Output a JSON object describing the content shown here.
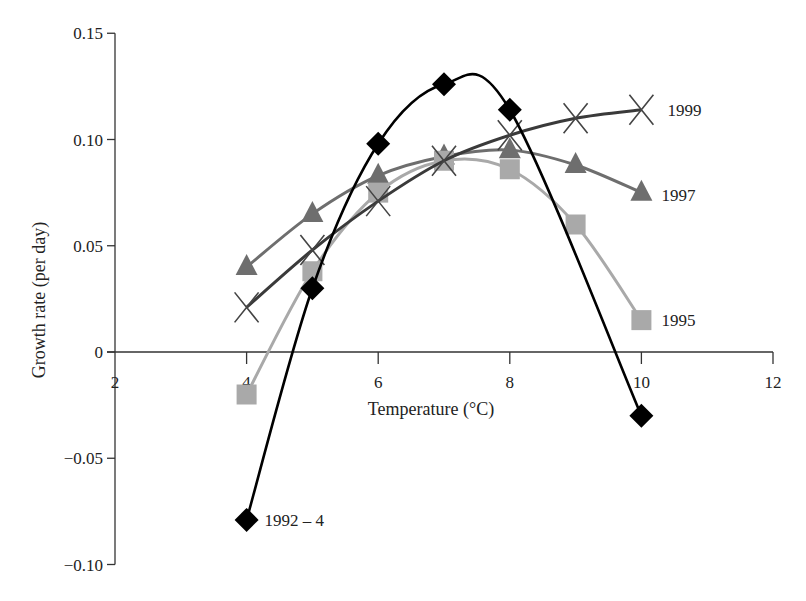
{
  "chart_data": {
    "type": "line",
    "title": "",
    "xlabel": "Temperature (°C)",
    "ylabel": "Growth rate (per day)",
    "xlim": [
      2,
      12
    ],
    "ylim": [
      -0.1,
      0.15
    ],
    "xticks": [
      2,
      4,
      6,
      8,
      10,
      12
    ],
    "xtick_labels": [
      "2",
      "4",
      "6",
      "8",
      "10",
      "12"
    ],
    "yticks": [
      -0.1,
      -0.05,
      0,
      0.05,
      0.1,
      0.15
    ],
    "ytick_labels": [
      "−0.10",
      "−0.05",
      "0",
      "0.05",
      "0.10",
      "0.15"
    ],
    "grid": false,
    "legend": "inline labels at line ends",
    "series": [
      {
        "name": "1992 – 4",
        "marker": "diamond",
        "color": "#000000",
        "x": [
          4,
          5,
          6,
          7,
          8,
          10
        ],
        "values": [
          -0.079,
          0.03,
          0.098,
          0.126,
          0.114,
          -0.03
        ]
      },
      {
        "name": "1995",
        "marker": "square",
        "color": "#a9a9a9",
        "x": [
          4,
          5,
          6,
          7,
          8,
          9,
          10
        ],
        "values": [
          -0.02,
          0.038,
          0.075,
          0.09,
          0.086,
          0.06,
          0.015
        ]
      },
      {
        "name": "1997",
        "marker": "triangle",
        "color": "#6e6e6e",
        "x": [
          4,
          5,
          6,
          7,
          8,
          9,
          10
        ],
        "values": [
          0.04,
          0.065,
          0.083,
          0.092,
          0.095,
          0.088,
          0.075
        ]
      },
      {
        "name": "1999",
        "marker": "x",
        "color": "#3a3a3a",
        "x": [
          4,
          5,
          6,
          7,
          8,
          9,
          10
        ],
        "values": [
          0.021,
          0.048,
          0.071,
          0.09,
          0.102,
          0.11,
          0.114
        ]
      }
    ]
  }
}
